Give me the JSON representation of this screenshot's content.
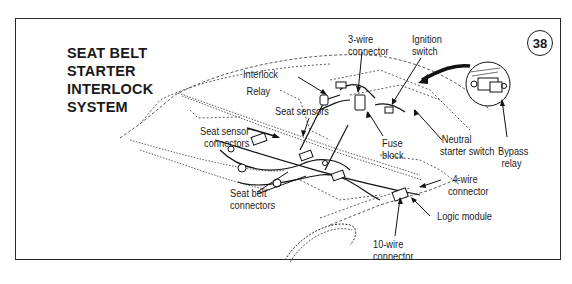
{
  "figure": {
    "number": "38",
    "title_lines": [
      "SEAT  BELT",
      "STARTER",
      "INTERLOCK",
      "SYSTEM"
    ]
  },
  "labels": {
    "three_wire_connector": [
      "3-wire",
      "connector"
    ],
    "ignition_switch": [
      "Ignition",
      "switch"
    ],
    "interlock_relay": [
      "Interlock",
      "Relay"
    ],
    "seat_sensors": "Seat sensors",
    "seat_sensor_connectors": [
      "Seat sensor",
      "connectors"
    ],
    "fuse_block": [
      "Fuse",
      "block"
    ],
    "neutral_starter_switch": [
      "Neutral",
      "starter switch"
    ],
    "bypass_relay": [
      "Bypass",
      "relay"
    ],
    "four_wire_connector": [
      "4-wire",
      "connector"
    ],
    "seat_belt_connectors": [
      "Seat belt",
      "connectors"
    ],
    "logic_module": "Logic module",
    "ten_wire_connector": [
      "10-wire",
      "connector"
    ]
  },
  "colors": {
    "ink": "#1a1a1a",
    "background": "#ffffff"
  }
}
